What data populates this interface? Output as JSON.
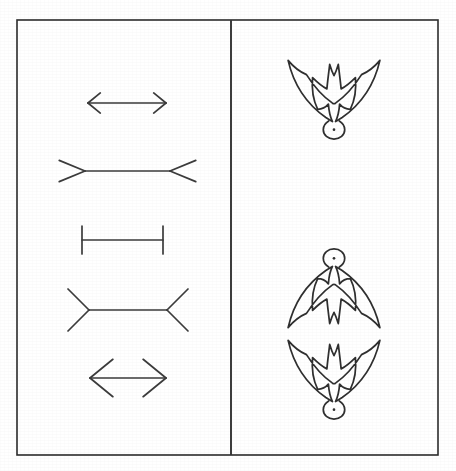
{
  "figure": {
    "title": "Line figures and bird silhouette figures",
    "background_color": "#ffffff",
    "ink_color": "#2e2e2e",
    "width": 456,
    "height": 471,
    "frame": {
      "stroke_color": "#2b2b2b",
      "x": 17,
      "y": 20,
      "width": 421,
      "height": 435
    },
    "divider": {
      "label": "vertical divider between left and right panels",
      "stroke_color": "#333333",
      "x": 231,
      "y_top": 20,
      "y_bottom": 455
    }
  },
  "left_panel": {
    "name": "line-figure-panel",
    "description": "Column of four horizontal line figures (Muller-Lyer illusion variants)",
    "items": [
      {
        "id": "fig-a",
        "label": "double-headed arrow, small",
        "shaft_x1": 88,
        "shaft_x2": 166,
        "shaft_y": 103,
        "fin_style": "arrowheads-inward",
        "fin_length": 14
      },
      {
        "id": "fig-b",
        "label": "line with outward fins, wide",
        "shaft_x1": 85,
        "shaft_x2": 170,
        "shaft_y": 171,
        "fin_style": "fins-outward",
        "fin_length": 28
      },
      {
        "id": "fig-c",
        "label": "line with perpendicular end bars",
        "shaft_x1": 82,
        "shaft_x2": 163,
        "shaft_y": 240,
        "fin_style": "end-bars",
        "fin_length": 14
      },
      {
        "id": "fig-d",
        "label": "line with inward fins, wide",
        "shaft_x1": 89,
        "shaft_x2": 167,
        "shaft_y": 310,
        "fin_style": "fins-inward",
        "fin_length": 28
      },
      {
        "id": "fig-e",
        "label": "double-headed arrow, large",
        "shaft_x1": 90,
        "shaft_x2": 166,
        "shaft_y": 378,
        "fin_style": "arrowheads-inward-large",
        "fin_length": 26
      }
    ]
  },
  "right_panel": {
    "name": "bird-figure-panel",
    "description": "Bird (swallow) outline silhouettes; one alone at top, a mirrored pair at bottom",
    "items": [
      {
        "id": "bird-top",
        "label": "swallow outline, wings up, head down",
        "orientation": "upright",
        "center_x": 334,
        "center_y": 95
      },
      {
        "id": "bird-middle",
        "label": "swallow outline, inverted, head up",
        "orientation": "inverted",
        "center_x": 334,
        "center_y": 293
      },
      {
        "id": "bird-bottom",
        "label": "swallow outline, wings up, head down",
        "orientation": "upright",
        "center_x": 334,
        "center_y": 375
      }
    ]
  }
}
